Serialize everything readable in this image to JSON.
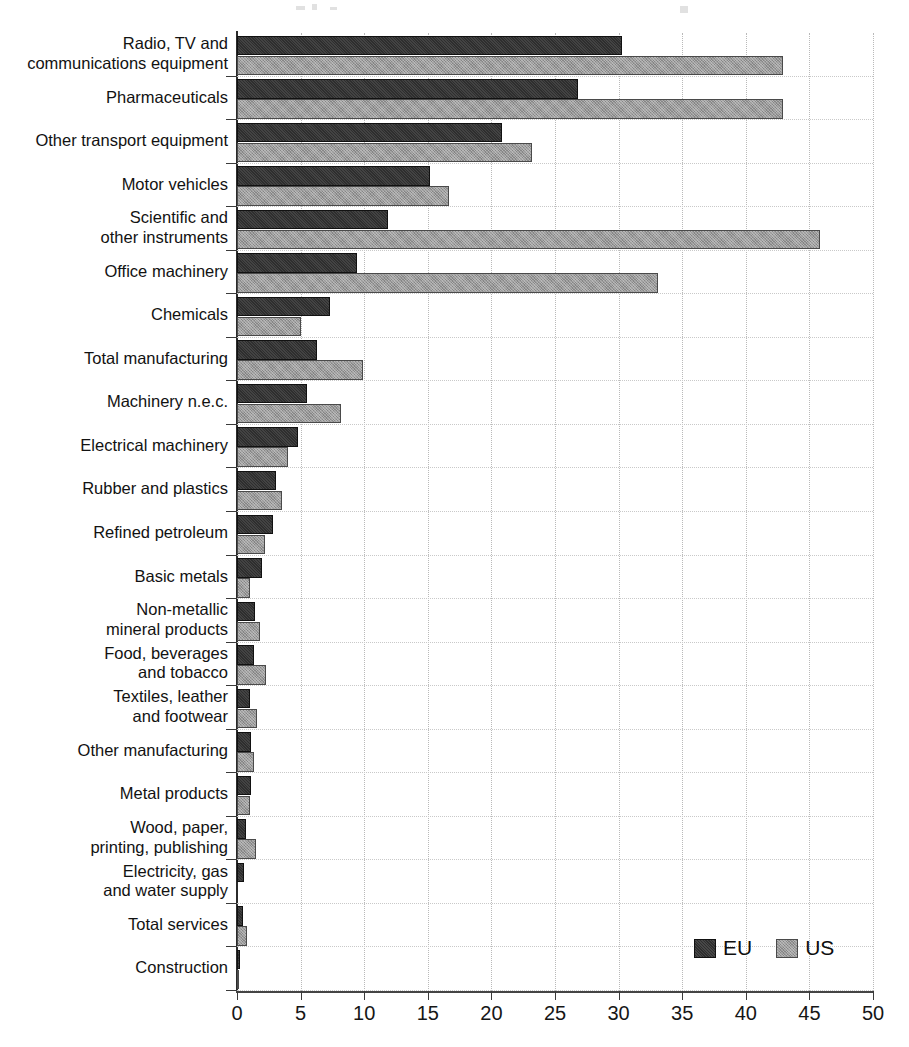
{
  "chart_data": {
    "type": "bar",
    "orientation": "horizontal",
    "title": "",
    "subtitle": "",
    "xlabel": "",
    "ylabel": "",
    "xlim": [
      0,
      50
    ],
    "xticks": [
      0,
      5,
      10,
      15,
      20,
      25,
      30,
      35,
      40,
      45,
      50
    ],
    "xtick_labels": [
      "0",
      "5",
      "10",
      "15",
      "20",
      "25",
      "30",
      "35",
      "40",
      "45",
      "50"
    ],
    "grid": true,
    "grid_axis": "both",
    "legend": {
      "position": "bottom-right",
      "entries": [
        {
          "name": "EU",
          "color": "#2e2e2e"
        },
        {
          "name": "US",
          "color": "#9a9a9a"
        }
      ]
    },
    "categories": [
      "Radio, TV and\ncommunications equipment",
      "Pharmaceuticals",
      "Other transport equipment",
      "Motor vehicles",
      "Scientific and\nother instruments",
      "Office machinery",
      "Chemicals",
      "Total manufacturing",
      "Machinery n.e.c.",
      "Electrical machinery",
      "Rubber and plastics",
      "Refined petroleum",
      "Basic metals",
      "Non-metallic\nmineral products",
      "Food, beverages\nand tobacco",
      "Textiles, leather\nand footwear",
      "Other manufacturing",
      "Metal products",
      "Wood, paper,\nprinting, publishing",
      "Electricity, gas\nand water supply",
      "Total services",
      "Construction"
    ],
    "series": [
      {
        "name": "EU",
        "color": "#2e2e2e",
        "values": [
          30.3,
          26.8,
          20.8,
          15.2,
          11.9,
          9.4,
          7.3,
          6.3,
          5.5,
          4.8,
          3.1,
          2.8,
          2.0,
          1.4,
          1.3,
          1.0,
          1.1,
          1.1,
          0.7,
          0.55,
          0.5,
          0.2
        ]
      },
      {
        "name": "US",
        "color": "#9a9a9a",
        "values": [
          42.9,
          42.9,
          23.2,
          16.7,
          45.8,
          33.1,
          5.0,
          9.9,
          8.2,
          4.0,
          3.5,
          2.2,
          1.0,
          1.8,
          2.3,
          1.6,
          1.3,
          1.0,
          1.5,
          0.0,
          0.8,
          0.1
        ]
      }
    ]
  },
  "axis": {
    "x_tick_labels": [
      "0",
      "5",
      "10",
      "15",
      "20",
      "25",
      "30",
      "35",
      "40",
      "45",
      "50"
    ]
  },
  "legend": {
    "eu_label": "EU",
    "us_label": "US"
  }
}
